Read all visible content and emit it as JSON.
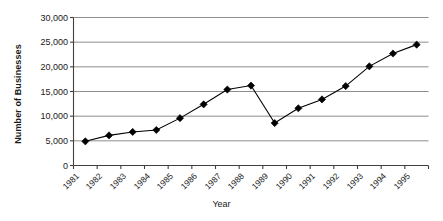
{
  "chart_data": {
    "type": "line",
    "title": "",
    "xlabel": "Year",
    "ylabel": "Number of Businesses",
    "categories": [
      "1981",
      "1982",
      "1983",
      "1984",
      "1985",
      "1986",
      "1987",
      "1988",
      "1989",
      "1990",
      "1991",
      "1992",
      "1993",
      "1994",
      "1995"
    ],
    "values": [
      4900,
      6100,
      6800,
      7200,
      9600,
      12400,
      15400,
      16200,
      8600,
      11600,
      13400,
      16100,
      20100,
      22700,
      24500
    ],
    "ylim": [
      0,
      30000
    ],
    "ytick_values": [
      0,
      5000,
      10000,
      15000,
      20000,
      25000,
      30000
    ],
    "ytick_labels": [
      "0",
      "5,000",
      "10,000",
      "15,000",
      "20,000",
      "25,000",
      "30,000"
    ],
    "grid": true,
    "legend": "none",
    "marker": "diamond",
    "series_color": "#000000",
    "grid_color": "#808080",
    "axis_color": "#404040",
    "background": "#ffffff"
  }
}
